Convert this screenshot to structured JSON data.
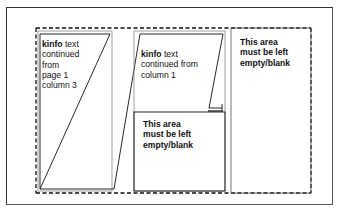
{
  "diagram": {
    "column1": {
      "keyword": "kinfo",
      "text_lines": [
        " text",
        "continued",
        "from",
        "page 1",
        "column 3"
      ]
    },
    "column2": {
      "keyword": "kinfo",
      "text_lines": [
        " text",
        "continued from",
        "column 1"
      ],
      "blank_area_lines": [
        "This area",
        "must be left",
        "empty/blank"
      ]
    },
    "column3": {
      "blank_area_lines": [
        "This area",
        "must be left",
        "empty/blank"
      ]
    },
    "colors": {
      "line": "#111111",
      "page_border": "#444444",
      "background": "#ffffff"
    }
  }
}
